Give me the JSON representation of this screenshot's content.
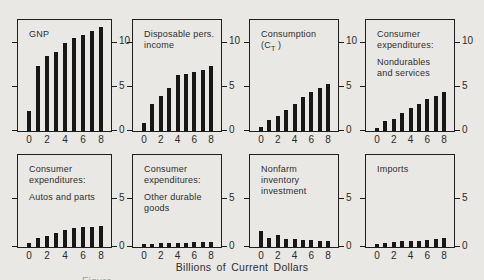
{
  "page": {
    "background": "#e9e8e4",
    "ink": "#1f1f1f",
    "axis_caption": "Billions of Current Dollars",
    "partial_caption": "Figure"
  },
  "chart_data": [
    {
      "type": "bar",
      "title": "GNP",
      "title_lines": [
        "GNP"
      ],
      "x": [
        0,
        1,
        2,
        3,
        4,
        5,
        6,
        7,
        8
      ],
      "values": [
        2.3,
        7.3,
        8.4,
        8.9,
        9.9,
        10.5,
        10.8,
        11.3,
        11.7
      ],
      "x_ticks": [
        0,
        2,
        4,
        6,
        8
      ],
      "y_ticks": [
        0,
        5,
        10
      ],
      "ylim": [
        0,
        12.5
      ],
      "xlabel": "Billions of Current Dollars",
      "grid": false
    },
    {
      "type": "bar",
      "title": "Disposable pers. income",
      "title_lines": [
        "Disposable pers.",
        "income"
      ],
      "x": [
        0,
        1,
        2,
        3,
        4,
        5,
        6,
        7,
        8
      ],
      "values": [
        0.9,
        3.0,
        3.9,
        4.9,
        6.3,
        6.4,
        6.7,
        6.9,
        7.3
      ],
      "x_ticks": [
        0,
        2,
        4,
        6,
        8
      ],
      "y_ticks": [
        0,
        5,
        10
      ],
      "ylim": [
        0,
        12.5
      ],
      "xlabel": "Billions of Current Dollars",
      "grid": false
    },
    {
      "type": "bar",
      "title": "Consumption (C_T)",
      "title_lines": [
        "Consumption",
        "(C_T )"
      ],
      "x": [
        0,
        1,
        2,
        3,
        4,
        5,
        6,
        7,
        8
      ],
      "values": [
        0.4,
        1.2,
        1.7,
        2.4,
        3.1,
        3.8,
        4.4,
        4.9,
        5.3
      ],
      "x_ticks": [
        0,
        2,
        4,
        6,
        8
      ],
      "y_ticks": [
        0,
        5,
        10
      ],
      "ylim": [
        0,
        12.5
      ],
      "xlabel": "Billions of Current Dollars",
      "grid": false
    },
    {
      "type": "bar",
      "title": "Consumer expenditures: Nondurables and services",
      "title_lines": [
        "Consumer",
        "expenditures:",
        "",
        "Nondurables",
        "and services"
      ],
      "x": [
        0,
        1,
        2,
        3,
        4,
        5,
        6,
        7,
        8
      ],
      "values": [
        0.3,
        1.1,
        1.4,
        2.0,
        2.6,
        3.1,
        3.6,
        4.0,
        4.4
      ],
      "x_ticks": [
        0,
        2,
        4,
        6,
        8
      ],
      "y_ticks": [
        0,
        5,
        10
      ],
      "ylim": [
        0,
        12.5
      ],
      "xlabel": "Billions of Current Dollars",
      "grid": false
    },
    {
      "type": "bar",
      "title": "Consumer expenditures: Autos and parts",
      "title_lines": [
        "Consumer",
        "expenditures:",
        "",
        "Autos and parts"
      ],
      "x": [
        0,
        1,
        2,
        3,
        4,
        5,
        6,
        7,
        8
      ],
      "values": [
        0.45,
        0.95,
        1.15,
        1.5,
        1.75,
        1.95,
        2.05,
        2.1,
        2.2
      ],
      "x_ticks": [
        0,
        2,
        4,
        6,
        8
      ],
      "y_ticks": [
        0,
        5
      ],
      "ylim": [
        0,
        9.5
      ],
      "xlabel": "Billions of Current Dollars",
      "grid": false
    },
    {
      "type": "bar",
      "title": "Consumer expenditures: Other durable goods",
      "title_lines": [
        "Consumer",
        "expenditures:",
        "",
        "Other durable",
        "goods"
      ],
      "x": [
        0,
        1,
        2,
        3,
        4,
        5,
        6,
        7,
        8
      ],
      "values": [
        0.35,
        0.35,
        0.4,
        0.4,
        0.45,
        0.45,
        0.5,
        0.55,
        0.55
      ],
      "x_ticks": [
        0,
        2,
        4,
        6,
        8
      ],
      "y_ticks": [
        0,
        5
      ],
      "ylim": [
        0,
        9.5
      ],
      "xlabel": "Billions of Current Dollars",
      "grid": false
    },
    {
      "type": "bar",
      "title": "Nonfarm inventory investment",
      "title_lines": [
        "Nonfarm",
        "inventory",
        "investment"
      ],
      "x": [
        0,
        1,
        2,
        3,
        4,
        5,
        6,
        7,
        8
      ],
      "values": [
        1.7,
        0.95,
        1.2,
        0.85,
        0.8,
        0.7,
        0.7,
        0.65,
        0.6
      ],
      "x_ticks": [
        0,
        2,
        4,
        6,
        8
      ],
      "y_ticks": [
        0,
        5
      ],
      "ylim": [
        0,
        9.5
      ],
      "xlabel": "Billions of Current Dollars",
      "grid": false
    },
    {
      "type": "bar",
      "title": "Imports",
      "title_lines": [
        "Imports"
      ],
      "x": [
        0,
        1,
        2,
        3,
        4,
        5,
        6,
        7,
        8
      ],
      "values": [
        0.3,
        0.45,
        0.5,
        0.6,
        0.65,
        0.65,
        0.7,
        0.8,
        0.9
      ],
      "x_ticks": [
        0,
        2,
        4,
        6,
        8
      ],
      "y_ticks": [
        0,
        5
      ],
      "ylim": [
        0,
        9.5
      ],
      "xlabel": "Billions of Current Dollars",
      "grid": false
    }
  ]
}
